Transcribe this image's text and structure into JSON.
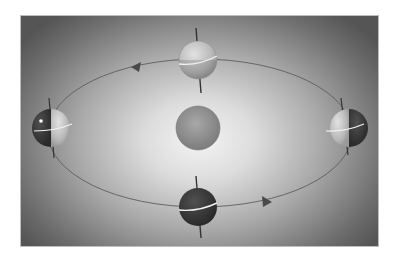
{
  "diagram": {
    "type": "earth-orbit-seasons",
    "colors": {
      "sun": "#8f8f8f",
      "orbit": "#5a5a5a",
      "earth_light": "#c8c8c8",
      "earth_dark": "#3a3a3a",
      "equator": "#f2f2f2",
      "background_edge": "#5a5a5a",
      "background_center": "#f4f4f4"
    },
    "sun": {
      "label": "Sun",
      "cx": 198,
      "cy": 128,
      "r": 22
    },
    "orbit": {
      "cx": 200,
      "cy": 133,
      "rx": 152,
      "ry": 74,
      "direction": "counterclockwise"
    },
    "earths": [
      {
        "position": "top",
        "cx": 198,
        "cy": 60,
        "r": 19,
        "lit": "full"
      },
      {
        "position": "left",
        "cx": 51,
        "cy": 128,
        "r": 19,
        "lit": "right-half"
      },
      {
        "position": "right",
        "cx": 349,
        "cy": 128,
        "r": 19,
        "lit": "left-half"
      },
      {
        "position": "bottom",
        "cx": 198,
        "cy": 207,
        "r": 19,
        "lit": "none"
      }
    ],
    "arrows": [
      {
        "x": 137,
        "y": 68,
        "direction": "left"
      },
      {
        "x": 266,
        "y": 202,
        "direction": "right"
      }
    ]
  }
}
